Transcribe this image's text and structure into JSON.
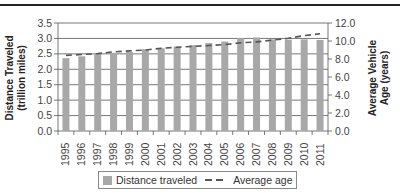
{
  "chart_data": {
    "type": "bar",
    "title": "",
    "categories": [
      "1995",
      "1996",
      "1997",
      "1998",
      "1999",
      "2000",
      "2001",
      "2002",
      "2003",
      "2004",
      "2005",
      "2006",
      "2007",
      "2008",
      "2009",
      "2010",
      "2011"
    ],
    "series": [
      {
        "name": "Distance traveled",
        "type": "bar",
        "axis": "left",
        "color": "#a8a8a8",
        "values": [
          2.36,
          2.42,
          2.49,
          2.53,
          2.56,
          2.65,
          2.68,
          2.73,
          2.78,
          2.85,
          2.9,
          3.01,
          3.03,
          2.97,
          2.96,
          2.97,
          2.95
        ]
      },
      {
        "name": "Average age",
        "type": "line",
        "style": "dashed",
        "axis": "right",
        "color": "#555555",
        "values": [
          8.4,
          8.5,
          8.6,
          8.8,
          8.9,
          9.0,
          9.2,
          9.3,
          9.4,
          9.5,
          9.6,
          9.8,
          9.9,
          10.1,
          10.3,
          10.6,
          10.8
        ]
      }
    ],
    "xlabel": "",
    "ylabel": "Distance Traveled (trillion miles)",
    "ylabel_right": "Average Vehicle Age (years)",
    "ylim": [
      0,
      3.5
    ],
    "ylim_right": [
      0,
      12
    ],
    "yticks": [
      "0.0",
      "0.5",
      "1.0",
      "1.5",
      "2.0",
      "2.5",
      "3.0",
      "3.5"
    ],
    "yticks_right": [
      "0.0",
      "2.0",
      "4.0",
      "6.0",
      "8.0",
      "10.0",
      "12.0"
    ],
    "grid": true,
    "legend_position": "bottom"
  },
  "labels": {
    "ylabel_left_line1": "Distance Traveled",
    "ylabel_left_line2": "(trillion miles)",
    "ylabel_right_line1": "Average Vehicle",
    "ylabel_right_line2": "Age (years)"
  },
  "legend": {
    "bar_label": "Distance traveled",
    "line_label": "Average age"
  }
}
